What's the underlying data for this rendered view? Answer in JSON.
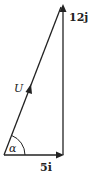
{
  "diagram": {
    "type": "vector-triangle",
    "vectors": [
      {
        "name": "hypotenuse",
        "label": "U",
        "direction": "up-right"
      },
      {
        "name": "horizontal",
        "label": "5i",
        "direction": "right"
      },
      {
        "name": "vertical",
        "label": "12j",
        "direction": "up"
      }
    ],
    "angle": {
      "label": "α",
      "location": "between U and 5i"
    },
    "colors": {
      "stroke": "#222222",
      "background": "#ffffff"
    }
  },
  "labels": {
    "u": "U",
    "i_coef": "5",
    "i_unit": "i",
    "j_coef": "12",
    "j_unit": "j",
    "alpha": "α"
  }
}
